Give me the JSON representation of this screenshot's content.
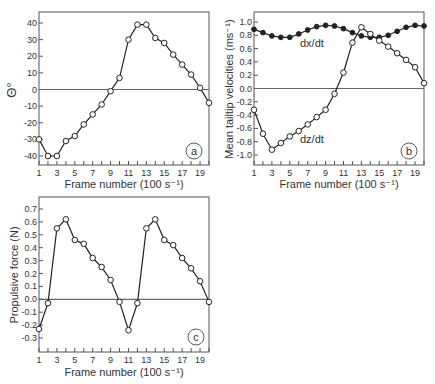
{
  "chart_data": [
    {
      "panel": "a",
      "type": "line",
      "xlabel": "Frame number (100 s⁻¹)",
      "ylabel": "Θ°",
      "x": [
        1,
        2,
        3,
        4,
        5,
        6,
        7,
        8,
        9,
        10,
        11,
        12,
        13,
        14,
        15,
        16,
        17,
        18,
        19,
        20
      ],
      "xticks": [
        "1",
        "3",
        "5",
        "7",
        "9",
        "11",
        "13",
        "15",
        "17",
        "19"
      ],
      "yticks": [
        "40",
        "30",
        "20",
        "10",
        "0",
        "-10",
        "-20",
        "-30",
        "-40"
      ],
      "ylim": [
        -45,
        47
      ],
      "series": [
        {
          "name": "Θ",
          "marker": "open-circle",
          "values": [
            -30,
            -40,
            -40,
            -31,
            -28,
            -21,
            -15,
            -9,
            -1,
            7,
            30,
            39,
            39,
            31,
            28,
            21,
            15,
            9,
            1,
            -8
          ]
        }
      ],
      "zero_line": true,
      "panel_label": "a"
    },
    {
      "panel": "b",
      "type": "line",
      "xlabel": "Frame number (100 s⁻¹)",
      "ylabel": "Mean tailtip velocities (ms⁻¹)",
      "x": [
        1,
        2,
        3,
        4,
        5,
        6,
        7,
        8,
        9,
        10,
        11,
        12,
        13,
        14,
        15,
        16,
        17,
        18,
        19,
        20
      ],
      "xticks": [
        "1",
        "3",
        "5",
        "7",
        "9",
        "11",
        "13",
        "15",
        "17",
        "19"
      ],
      "yticks": [
        "1.0",
        "0.8",
        "0.6",
        "0.4",
        "0.2",
        "0.0",
        "-0.2",
        "-0.4",
        "-0.6",
        "-0.8",
        "-1.0"
      ],
      "ylim": [
        -1.15,
        1.15
      ],
      "series": [
        {
          "name": "dx/dt",
          "marker": "filled-circle",
          "values": [
            0.89,
            0.84,
            0.79,
            0.77,
            0.77,
            0.82,
            0.88,
            0.93,
            0.95,
            0.94,
            0.9,
            0.84,
            0.79,
            0.77,
            0.77,
            0.8,
            0.86,
            0.92,
            0.95,
            0.94
          ]
        },
        {
          "name": "dz/dt",
          "marker": "open-circle",
          "values": [
            -0.32,
            -0.68,
            -0.92,
            -0.82,
            -0.72,
            -0.64,
            -0.54,
            -0.43,
            -0.32,
            -0.08,
            0.24,
            0.69,
            0.92,
            0.82,
            0.72,
            0.63,
            0.53,
            0.43,
            0.32,
            0.08
          ]
        }
      ],
      "zero_line": true,
      "panel_label": "b"
    },
    {
      "panel": "c",
      "type": "line",
      "xlabel": "Frame number (100 s⁻¹)",
      "ylabel": "Propulsive force (N)",
      "x": [
        1,
        2,
        3,
        4,
        5,
        6,
        7,
        8,
        9,
        10,
        11,
        12,
        13,
        14,
        15,
        16,
        17,
        18,
        19,
        20
      ],
      "xticks": [
        "1",
        "3",
        "5",
        "7",
        "9",
        "11",
        "13",
        "15",
        "17",
        "19"
      ],
      "yticks": [
        "0.7",
        "0.6",
        "0.5",
        "0.4",
        "0.3",
        "0.2",
        "0.1",
        "0.0",
        "-0.1",
        "-0.2",
        "-0.3"
      ],
      "ylim": [
        -0.38,
        0.78
      ],
      "series": [
        {
          "name": "Propulsive force",
          "marker": "open-circle",
          "values": [
            -0.23,
            -0.03,
            0.55,
            0.62,
            0.46,
            0.43,
            0.32,
            0.25,
            0.15,
            -0.02,
            -0.24,
            -0.03,
            0.55,
            0.62,
            0.46,
            0.42,
            0.32,
            0.24,
            0.14,
            -0.02
          ]
        }
      ],
      "zero_line": true,
      "panel_label": "c"
    }
  ],
  "labels": {
    "a_ylabel": "Θ°",
    "b_ylabel": "Mean tailtip velocities (ms⁻¹)",
    "c_ylabel": "Propulsive force (N)",
    "xlabel": "Frame number (100 s⁻¹)",
    "dx_label": "dx/dt",
    "dz_label": "dz/dt",
    "panel_a": "a",
    "panel_b": "b",
    "panel_c": "c"
  }
}
